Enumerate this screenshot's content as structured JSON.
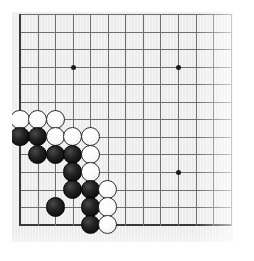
{
  "app": {
    "title": "Go Board Diagram",
    "description": "Go (Weiqi/Baduk) board diagram showing a corner fight in the lower-left corner"
  },
  "board": {
    "game": "Go",
    "view": "lower-left corner crop",
    "visible_columns": 13,
    "visible_rows": 13,
    "line_spacing_px": 17.55,
    "origin_x_px": 20,
    "origin_y_px": 14,
    "colors": {
      "field": "#ececec",
      "grid_line": "#6e6e6e",
      "edge_line": "#3a3a3a",
      "star_point": "#1a1a1a",
      "black_stone": "#111111",
      "white_stone": "#fbfbfb",
      "page_background": "#ffffff"
    },
    "edges": {
      "left": true,
      "top": false,
      "right": false,
      "bottom": true
    },
    "star_points": [
      {
        "col": 4,
        "row": 4
      },
      {
        "col": 10,
        "row": 4
      },
      {
        "col": 10,
        "row": 10
      }
    ],
    "stone_radius_px": 9.6,
    "stones": [
      {
        "color": "white",
        "col": 1,
        "row": 7
      },
      {
        "color": "white",
        "col": 2,
        "row": 7
      },
      {
        "color": "white",
        "col": 3,
        "row": 7
      },
      {
        "color": "black",
        "col": 1,
        "row": 8
      },
      {
        "color": "black",
        "col": 2,
        "row": 8
      },
      {
        "color": "white",
        "col": 3,
        "row": 8
      },
      {
        "color": "white",
        "col": 4,
        "row": 8
      },
      {
        "color": "white",
        "col": 5,
        "row": 8
      },
      {
        "color": "black",
        "col": 2,
        "row": 9
      },
      {
        "color": "black",
        "col": 3,
        "row": 9
      },
      {
        "color": "black",
        "col": 4,
        "row": 9
      },
      {
        "color": "white",
        "col": 5,
        "row": 9
      },
      {
        "color": "black",
        "col": 4,
        "row": 10
      },
      {
        "color": "white",
        "col": 5,
        "row": 10
      },
      {
        "color": "black",
        "col": 4,
        "row": 11
      },
      {
        "color": "black",
        "col": 5,
        "row": 11
      },
      {
        "color": "white",
        "col": 6,
        "row": 11
      },
      {
        "color": "black",
        "col": 3,
        "row": 12
      },
      {
        "color": "black",
        "col": 5,
        "row": 12
      },
      {
        "color": "white",
        "col": 6,
        "row": 12
      },
      {
        "color": "black",
        "col": 5,
        "row": 13
      },
      {
        "color": "white",
        "col": 6,
        "row": 13
      }
    ],
    "counts": {
      "black_stones": 11,
      "white_stones": 11,
      "total_stones": 22
    }
  }
}
